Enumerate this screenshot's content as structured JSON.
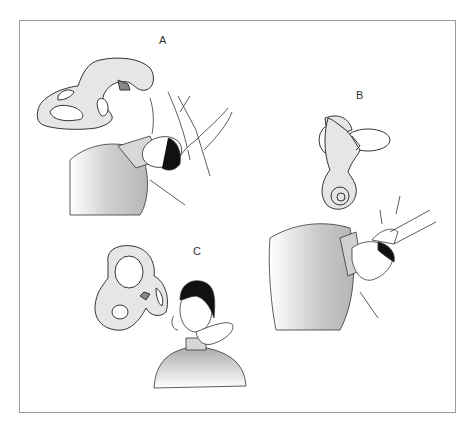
{
  "figure": {
    "panels": [
      {
        "label": "A",
        "content": "Patient supine, head turned and extended back over table edge held by examiner's hands; semicircular canals shown above"
      },
      {
        "label": "B",
        "content": "Patient lying, head turned to opposite side held by examiner; labyrinth with cochlea shown above"
      },
      {
        "label": "C",
        "content": "Patient sitting upright, head tilted with examiner's hand at chin; labyrinth shown to left"
      }
    ]
  },
  "colors": {
    "frame": "#9a9a9a",
    "line": "#333333",
    "fill_labyrinth": "#e6e6e6",
    "fill_clothing": "#c8c8c8",
    "hair": "#111111"
  }
}
